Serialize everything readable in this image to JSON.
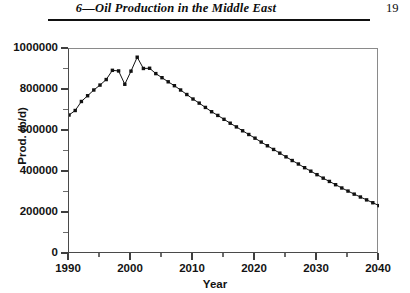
{
  "header": {
    "title": "6—Oil Production in the Middle East",
    "folio": "19"
  },
  "chart_data": {
    "type": "line",
    "title": "",
    "xlabel": "Year",
    "ylabel": "Prod. (b/d)",
    "xlim": [
      1990,
      2040
    ],
    "ylim": [
      0,
      1000000
    ],
    "x_major_ticks": [
      1990,
      2000,
      2010,
      2020,
      2030,
      2040
    ],
    "x_minor_ticks": [
      1995,
      2005,
      2015,
      2025,
      2035
    ],
    "y_major_ticks": [
      0,
      200000,
      400000,
      600000,
      800000,
      1000000
    ],
    "y_minor_ticks": [
      100000,
      300000,
      500000,
      700000,
      900000
    ],
    "y_tick_labels": [
      "0",
      "200000",
      "400000",
      "600000",
      "800000",
      "1000000"
    ],
    "x_tick_labels": [
      "1990",
      "2000",
      "2010",
      "2020",
      "2030",
      "2040"
    ],
    "grid": false,
    "legend": false,
    "marker": "square",
    "marker_color": "#111111",
    "line_color": "#111111",
    "series": [
      {
        "name": "Middle East oil production",
        "x": [
          1990,
          1991,
          1992,
          1993,
          1994,
          1995,
          1996,
          1997,
          1998,
          1999,
          2000,
          2001,
          2002,
          2003,
          2004,
          2005,
          2006,
          2007,
          2008,
          2009,
          2010,
          2011,
          2012,
          2013,
          2014,
          2015,
          2016,
          2017,
          2018,
          2019,
          2020,
          2021,
          2022,
          2023,
          2024,
          2025,
          2026,
          2027,
          2028,
          2029,
          2030,
          2031,
          2032,
          2033,
          2034,
          2035,
          2036,
          2037,
          2038,
          2039,
          2040
        ],
        "values": [
          678000,
          700000,
          744000,
          772000,
          800000,
          824000,
          851000,
          896000,
          893000,
          828000,
          892000,
          960000,
          905000,
          906000,
          880000,
          860000,
          840000,
          821000,
          800000,
          778000,
          756000,
          736000,
          715000,
          694000,
          676000,
          657000,
          638000,
          620000,
          601000,
          583000,
          565000,
          546000,
          528000,
          510000,
          492000,
          474000,
          456000,
          439000,
          421000,
          404000,
          387000,
          370000,
          354000,
          338000,
          322000,
          307000,
          292000,
          278000,
          264000,
          250000,
          236000
        ]
      }
    ]
  }
}
